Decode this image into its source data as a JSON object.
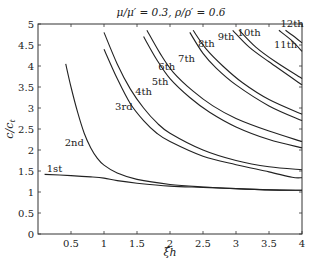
{
  "chart_data": {
    "type": "line",
    "title": "μ/μ′ = 0.3,  ρ/ρ′ = 0.6",
    "xlabel": "ξh",
    "ylabel": "c/c_t",
    "xlim": [
      0,
      4
    ],
    "ylim": [
      0,
      5
    ],
    "xticks": [
      "0.5",
      "1",
      "1.5",
      "2",
      "2.5",
      "3",
      "3.5",
      "4"
    ],
    "yticks": [
      "0",
      "0.5",
      "1",
      "1.5",
      "2",
      "2.5",
      "3",
      "3.5",
      "4",
      "4.5",
      "5"
    ],
    "grid": false,
    "series": [
      {
        "name": "1st",
        "label_at": [
          0.25,
          1.48
        ],
        "points": [
          [
            0.1,
            1.42
          ],
          [
            0.5,
            1.39
          ],
          [
            0.8,
            1.36
          ],
          [
            1.0,
            1.33
          ],
          [
            1.2,
            1.27
          ],
          [
            1.5,
            1.21
          ],
          [
            2.0,
            1.14
          ],
          [
            2.5,
            1.11
          ],
          [
            3.0,
            1.08
          ],
          [
            3.5,
            1.05
          ],
          [
            4.0,
            1.04
          ]
        ]
      },
      {
        "name": "2nd",
        "label_at": [
          0.55,
          2.1
        ],
        "points": [
          [
            0.42,
            4.05
          ],
          [
            0.5,
            3.5
          ],
          [
            0.6,
            2.9
          ],
          [
            0.7,
            2.4
          ],
          [
            0.8,
            2.05
          ],
          [
            0.9,
            1.8
          ],
          [
            1.0,
            1.64
          ],
          [
            1.2,
            1.45
          ],
          [
            1.5,
            1.3
          ],
          [
            2.0,
            1.18
          ],
          [
            2.5,
            1.12
          ],
          [
            3.0,
            1.08
          ],
          [
            3.5,
            1.05
          ],
          [
            4.0,
            1.04
          ]
        ]
      },
      {
        "name": "3rd",
        "label_at": [
          1.3,
          2.95
        ],
        "points": [
          [
            1.0,
            4.4
          ],
          [
            1.2,
            3.7
          ],
          [
            1.4,
            3.1
          ],
          [
            1.6,
            2.7
          ],
          [
            1.8,
            2.4
          ],
          [
            2.0,
            2.2
          ],
          [
            2.5,
            1.85
          ],
          [
            3.0,
            1.65
          ],
          [
            3.5,
            1.48
          ],
          [
            3.85,
            1.35
          ],
          [
            4.0,
            1.34
          ]
        ]
      },
      {
        "name": "4th",
        "label_at": [
          1.6,
          3.3
        ],
        "points": [
          [
            1.0,
            4.8
          ],
          [
            1.2,
            4.05
          ],
          [
            1.4,
            3.45
          ],
          [
            1.6,
            3.0
          ],
          [
            1.8,
            2.65
          ],
          [
            2.0,
            2.4
          ],
          [
            2.5,
            2.0
          ],
          [
            3.0,
            1.75
          ],
          [
            3.5,
            1.6
          ],
          [
            4.0,
            1.53
          ]
        ]
      },
      {
        "name": "5th",
        "label_at": [
          1.85,
          3.55
        ],
        "points": [
          [
            1.6,
            4.7
          ],
          [
            1.8,
            4.15
          ],
          [
            2.0,
            3.7
          ],
          [
            2.3,
            3.25
          ],
          [
            2.6,
            2.9
          ],
          [
            3.0,
            2.55
          ],
          [
            3.5,
            2.25
          ],
          [
            4.0,
            2.05
          ]
        ]
      },
      {
        "name": "6th",
        "label_at": [
          1.95,
          3.9
        ],
        "points": [
          [
            1.65,
            4.85
          ],
          [
            1.85,
            4.3
          ],
          [
            2.05,
            3.85
          ],
          [
            2.35,
            3.4
          ],
          [
            2.65,
            3.05
          ],
          [
            3.0,
            2.75
          ],
          [
            3.5,
            2.45
          ],
          [
            4.0,
            2.2
          ]
        ]
      },
      {
        "name": "7th",
        "label_at": [
          2.25,
          4.1
        ],
        "points": [
          [
            2.3,
            4.8
          ],
          [
            2.5,
            4.3
          ],
          [
            2.7,
            3.95
          ],
          [
            3.0,
            3.55
          ],
          [
            3.5,
            3.05
          ],
          [
            4.0,
            2.7
          ]
        ]
      },
      {
        "name": "8th",
        "label_at": [
          2.55,
          4.45
        ],
        "points": [
          [
            2.35,
            4.85
          ],
          [
            2.55,
            4.4
          ],
          [
            2.8,
            4.0
          ],
          [
            3.1,
            3.6
          ],
          [
            3.5,
            3.2
          ],
          [
            4.0,
            2.85
          ]
        ]
      },
      {
        "name": "9th",
        "label_at": [
          2.85,
          4.62
        ],
        "points": [
          [
            2.95,
            4.85
          ],
          [
            3.2,
            4.45
          ],
          [
            3.5,
            4.1
          ],
          [
            4.0,
            3.55
          ]
        ]
      },
      {
        "name": "10th",
        "label_at": [
          3.2,
          4.72
        ],
        "points": [
          [
            3.05,
            4.85
          ],
          [
            3.3,
            4.45
          ],
          [
            3.6,
            4.1
          ],
          [
            4.0,
            3.7
          ]
        ]
      },
      {
        "name": "11th",
        "label_at": [
          3.75,
          4.42
        ],
        "points": [
          [
            3.65,
            4.85
          ],
          [
            3.85,
            4.6
          ],
          [
            4.0,
            4.35
          ]
        ]
      },
      {
        "name": "12th",
        "label_at": [
          3.85,
          4.92
        ],
        "points": [
          [
            3.75,
            4.85
          ],
          [
            3.9,
            4.68
          ],
          [
            4.0,
            4.55
          ]
        ]
      }
    ]
  }
}
